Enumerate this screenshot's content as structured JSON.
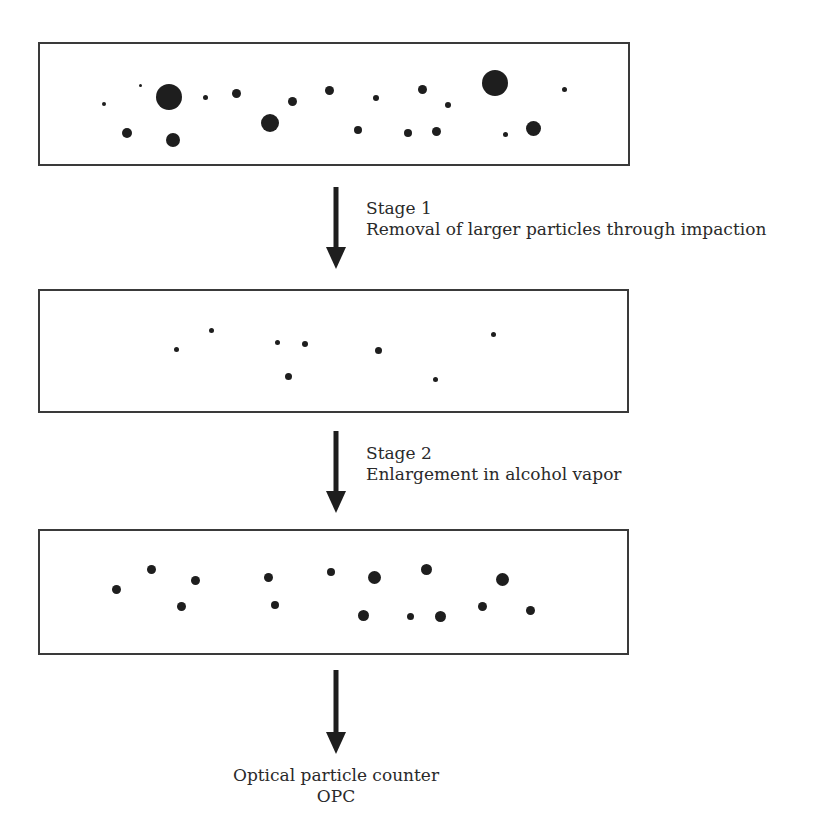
{
  "figure": {
    "boxes": [
      {
        "name": "inlet-aerosol",
        "particles": [
          {
            "x": 104,
            "y": 104,
            "r": 2
          },
          {
            "x": 140,
            "y": 85,
            "r": 1.5
          },
          {
            "x": 169,
            "y": 97,
            "r": 13
          },
          {
            "x": 205,
            "y": 97,
            "r": 2.5
          },
          {
            "x": 236,
            "y": 93,
            "r": 4.5
          },
          {
            "x": 292,
            "y": 101,
            "r": 4.5
          },
          {
            "x": 127,
            "y": 133,
            "r": 5
          },
          {
            "x": 173,
            "y": 140,
            "r": 7
          },
          {
            "x": 270,
            "y": 123,
            "r": 9
          },
          {
            "x": 329,
            "y": 90,
            "r": 4.5
          },
          {
            "x": 376,
            "y": 98,
            "r": 3
          },
          {
            "x": 422,
            "y": 89,
            "r": 4.5
          },
          {
            "x": 448,
            "y": 105,
            "r": 3
          },
          {
            "x": 495,
            "y": 83,
            "r": 13
          },
          {
            "x": 564,
            "y": 89,
            "r": 2.5
          },
          {
            "x": 358,
            "y": 130,
            "r": 4
          },
          {
            "x": 408,
            "y": 133,
            "r": 4
          },
          {
            "x": 436,
            "y": 131,
            "r": 4.5
          },
          {
            "x": 505,
            "y": 134,
            "r": 2.5
          },
          {
            "x": 533,
            "y": 128,
            "r": 7.5
          }
        ]
      },
      {
        "name": "after-impaction",
        "particles": [
          {
            "x": 176,
            "y": 349,
            "r": 2.5
          },
          {
            "x": 211,
            "y": 330,
            "r": 2.5
          },
          {
            "x": 277,
            "y": 342,
            "r": 2.5
          },
          {
            "x": 305,
            "y": 344,
            "r": 3
          },
          {
            "x": 288,
            "y": 376,
            "r": 3.5
          },
          {
            "x": 378,
            "y": 350,
            "r": 3.5
          },
          {
            "x": 493,
            "y": 334,
            "r": 2.5
          },
          {
            "x": 435,
            "y": 379,
            "r": 2.5
          }
        ]
      },
      {
        "name": "after-enlargement",
        "particles": [
          {
            "x": 116,
            "y": 589,
            "r": 4.5
          },
          {
            "x": 151,
            "y": 569,
            "r": 4.5
          },
          {
            "x": 195,
            "y": 580,
            "r": 4.5
          },
          {
            "x": 181,
            "y": 606,
            "r": 4.5
          },
          {
            "x": 268,
            "y": 577,
            "r": 4.5
          },
          {
            "x": 275,
            "y": 605,
            "r": 4
          },
          {
            "x": 331,
            "y": 572,
            "r": 4
          },
          {
            "x": 374,
            "y": 577,
            "r": 6.5
          },
          {
            "x": 426,
            "y": 569,
            "r": 5.5
          },
          {
            "x": 502,
            "y": 579,
            "r": 6.5
          },
          {
            "x": 363,
            "y": 615,
            "r": 5.5
          },
          {
            "x": 410,
            "y": 616,
            "r": 3.5
          },
          {
            "x": 440,
            "y": 616,
            "r": 5.5
          },
          {
            "x": 482,
            "y": 606,
            "r": 4.5
          },
          {
            "x": 530,
            "y": 610,
            "r": 4.5
          }
        ]
      }
    ],
    "stage1": {
      "title": "Stage 1",
      "description": "Removal of larger particles through impaction"
    },
    "stage2": {
      "title": "Stage 2",
      "description": "Enlargement in alcohol vapor"
    },
    "output": {
      "line1": "Optical particle counter",
      "line2": "OPC"
    }
  }
}
